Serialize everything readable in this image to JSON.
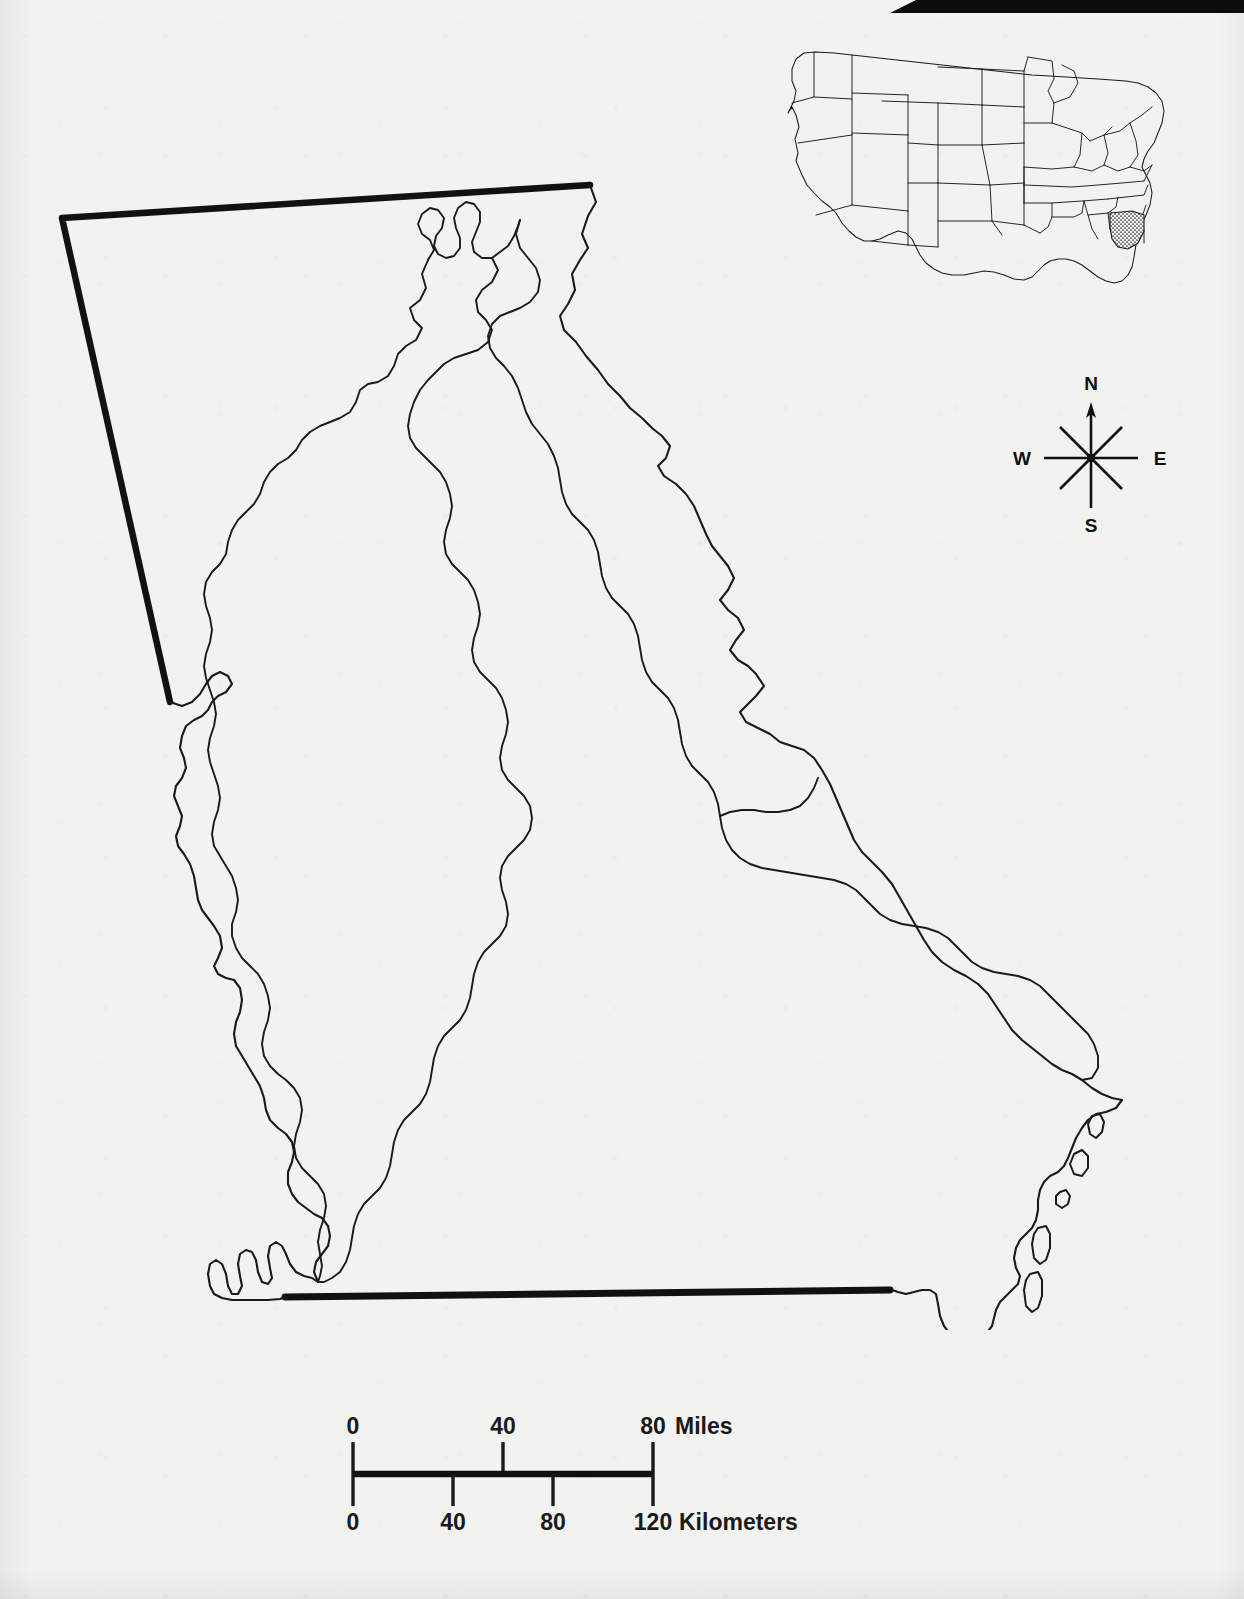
{
  "document": {
    "kind": "scanned-map-figure",
    "subject": "Georgia state outline with major river basin divides",
    "paper_color": "#f2f2f0",
    "ink_color": "#111111"
  },
  "artifact": {
    "name": "scanner-black-bar",
    "color": "#0d0d0d"
  },
  "inset": {
    "name": "united-states-locator-map",
    "highlighted_state": "Georgia",
    "highlight_style": "stipple",
    "outline_color": "#1a1a1a"
  },
  "compass": {
    "north": "N",
    "south": "S",
    "east": "E",
    "west": "W",
    "rays": 8,
    "arrow_on": "north"
  },
  "scale_bar": {
    "miles": {
      "unit_label": "Miles",
      "ticks": [
        "0",
        "40",
        "80"
      ],
      "max": 80
    },
    "kilometers": {
      "unit_label": "Kilometers",
      "ticks": [
        "0",
        "40",
        "80",
        "120"
      ],
      "max": 120
    }
  },
  "map": {
    "state_border_style": "thick",
    "interior_line_style": "thin",
    "features": [
      "state-boundary",
      "coastline-with-barrier-islands",
      "river-basin-divides"
    ]
  }
}
